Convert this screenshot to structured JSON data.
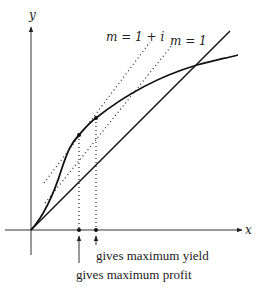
{
  "axes": {
    "x_label": "x",
    "y_label": "y"
  },
  "tangent_labels": {
    "m_1_plus_i": "m = 1 + i",
    "m_1": "m = 1"
  },
  "annotations": {
    "max_yield": "gives maximum yield",
    "max_profit": "gives maximum profit"
  },
  "colors": {
    "ink": "#111111",
    "background": "#ffffff"
  }
}
